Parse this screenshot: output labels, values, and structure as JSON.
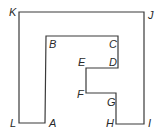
{
  "diagram": {
    "stroke_color": "#3a3a3a",
    "background": "#ffffff",
    "polygon": [
      {
        "label": "K",
        "x": 19,
        "y": 12
      },
      {
        "label": "J",
        "x": 144,
        "y": 12
      },
      {
        "label": "I",
        "x": 144,
        "y": 124
      },
      {
        "label": "H",
        "x": 116,
        "y": 124
      },
      {
        "label": "G",
        "x": 116,
        "y": 93
      },
      {
        "label": "F",
        "x": 86,
        "y": 93
      },
      {
        "label": "E",
        "x": 86,
        "y": 68
      },
      {
        "label": "D",
        "x": 118,
        "y": 68
      },
      {
        "label": "C",
        "x": 118,
        "y": 36
      },
      {
        "label": "B",
        "x": 46,
        "y": 36
      },
      {
        "label": "A",
        "x": 45,
        "y": 123
      },
      {
        "label": "L",
        "x": 19,
        "y": 123
      }
    ],
    "labels": {
      "K": "K",
      "J": "J",
      "B": "B",
      "C": "C",
      "E": "E",
      "D": "D",
      "F": "F",
      "G": "G",
      "L": "L",
      "A": "A",
      "H": "H",
      "I": "I"
    }
  }
}
